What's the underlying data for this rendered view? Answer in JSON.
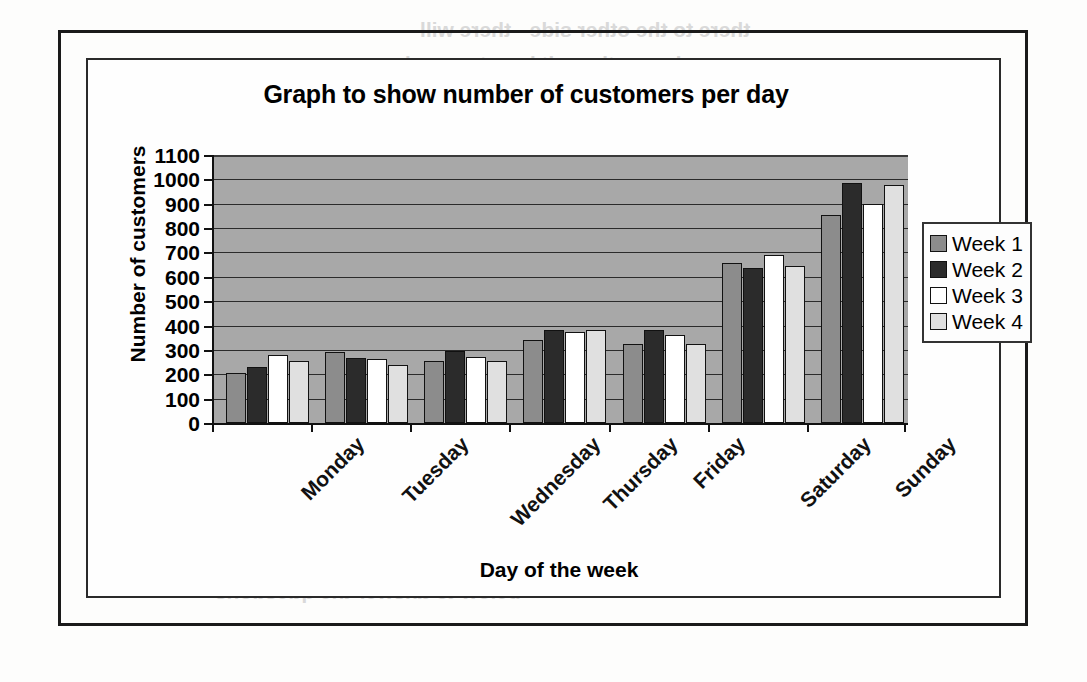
{
  "page": {
    "bleed_through_text": [
      "there to the other side - there will",
      "and sometimes it is not enough",
      "can be drawn on the same axes",
      "the largest of all the values",
      "is a category on the horizontal",
      "Week 1      Week 2      Week",
      "below to answer the questions"
    ]
  },
  "chart_data": {
    "type": "bar",
    "title": "Graph to show number of customers per day",
    "xlabel": "Day of the week",
    "ylabel": "Number of customers",
    "categories": [
      "Monday",
      "Tuesday",
      "Wednesday",
      "Thursday",
      "Friday",
      "Saturday",
      "Sunday"
    ],
    "series": [
      {
        "name": "Week 1",
        "color": "#8c8c8c",
        "values": [
          205,
          290,
          253,
          342,
          325,
          655,
          855
        ]
      },
      {
        "name": "Week 2",
        "color": "#2b2b2b",
        "values": [
          230,
          265,
          295,
          382,
          383,
          638,
          985
        ]
      },
      {
        "name": "Week 3",
        "color": "#ffffff",
        "values": [
          280,
          262,
          272,
          373,
          360,
          688,
          898
        ]
      },
      {
        "name": "Week 4",
        "color": "#e0e0e0",
        "values": [
          255,
          240,
          255,
          383,
          325,
          645,
          975
        ]
      }
    ],
    "y_ticks": [
      0,
      100,
      200,
      300,
      400,
      500,
      600,
      700,
      800,
      900,
      1000,
      1100
    ],
    "ylim": [
      0,
      1100
    ],
    "grid": true,
    "legend_position": "right",
    "plot_background": "#a8a8a8"
  }
}
